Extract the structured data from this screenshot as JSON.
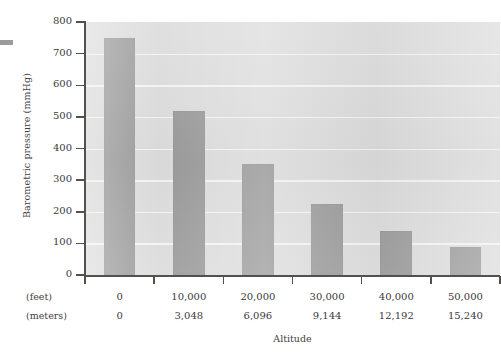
{
  "chart_data": {
    "type": "bar",
    "title": "",
    "xlabel": "Altitude",
    "ylabel": "Barometric pressure (mmHg)",
    "categories": [
      "0",
      "10,000",
      "20,000",
      "30,000",
      "40,000",
      "50,000"
    ],
    "categories_secondary": [
      "0",
      "3,048",
      "6,096",
      "9,144",
      "12,192",
      "15,240"
    ],
    "category_row_labels": [
      "(feet)",
      "(meters)"
    ],
    "values": [
      750,
      520,
      350,
      225,
      140,
      90
    ],
    "ylim": [
      0,
      800
    ],
    "ytick_labels": [
      "800",
      "700",
      "600",
      "500",
      "400",
      "300",
      "200",
      "100",
      "0"
    ],
    "ytick_values": [
      800,
      700,
      600,
      500,
      400,
      300,
      200,
      100,
      0
    ],
    "grid": "horizontal",
    "legend": "none",
    "bar_color": "#9a9a9a",
    "plot_background": "#dcdcdc",
    "gridline_color": "#f4f4f4",
    "axis_color": "#55504c"
  }
}
